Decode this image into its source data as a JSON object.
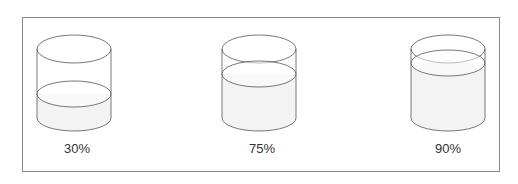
{
  "diagram": {
    "type": "cylinder-fill-levels",
    "stroke_color": "#555555",
    "fill_color": "#f3f3f3",
    "cylinders": [
      {
        "label": "30%",
        "fill_percent": 30
      },
      {
        "label": "75%",
        "fill_percent": 75
      },
      {
        "label": "90%",
        "fill_percent": 90
      }
    ]
  }
}
